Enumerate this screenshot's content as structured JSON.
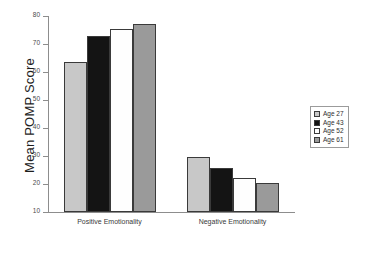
{
  "chart_data": {
    "type": "bar",
    "title": "",
    "xlabel": "",
    "ylabel": "Mean POMP Score",
    "ylim": [
      10,
      80
    ],
    "yticks": [
      10,
      20,
      30,
      40,
      50,
      60,
      70,
      80
    ],
    "ytick_labels": [
      "10",
      "20",
      "30",
      "40",
      "50",
      "60",
      "70",
      "80"
    ],
    "grid": false,
    "legend_position": "right",
    "categories": [
      "Positive Emotionality",
      "Negative Emotionality"
    ],
    "series": [
      {
        "name": "Age 27",
        "color": "#c8c8c8",
        "values": [
          63.5,
          29.8
        ]
      },
      {
        "name": "Age 43",
        "color": "#141414",
        "values": [
          72.8,
          25.6
        ]
      },
      {
        "name": "Age 52",
        "color": "#fefefe",
        "values": [
          75.2,
          22.2
        ]
      },
      {
        "name": "Age 61",
        "color": "#9a9a9a",
        "values": [
          77.0,
          20.5
        ]
      }
    ]
  },
  "legend": {
    "entries": [
      {
        "label": "Age 27"
      },
      {
        "label": "Age 43"
      },
      {
        "label": "Age 52"
      },
      {
        "label": "Age 61"
      }
    ]
  }
}
